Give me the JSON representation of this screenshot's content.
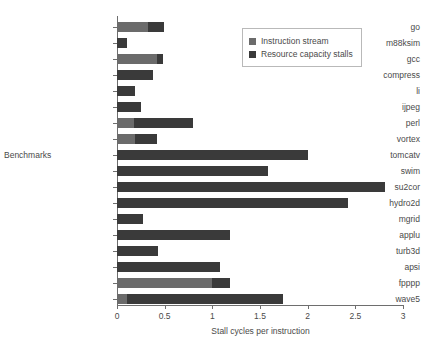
{
  "chart_data": {
    "type": "bar",
    "orientation": "horizontal",
    "stacked": true,
    "title": "",
    "xlabel": "Stall cycles per instruction",
    "ylabel": "Benchmarks",
    "xlim": [
      0,
      3
    ],
    "xticks": [
      0,
      0.5,
      1,
      1.5,
      2,
      2.5,
      3
    ],
    "xtick_labels": [
      "0",
      "0.5",
      "1",
      "1.5",
      "2",
      "2.5",
      "3"
    ],
    "grid": false,
    "legend_position": "top-right",
    "categories": [
      "go",
      "m88ksim",
      "gcc",
      "compress",
      "li",
      "ijpeg",
      "perl",
      "vortex",
      "tomcatv",
      "swim",
      "su2cor",
      "hydro2d",
      "mgrid",
      "applu",
      "turb3d",
      "apsi",
      "fpppp",
      "wave5"
    ],
    "series": [
      {
        "name": "Instruction stream",
        "color": "#6b6b6b",
        "values": [
          0.33,
          0.0,
          0.42,
          0.0,
          0.0,
          0.0,
          0.18,
          0.19,
          0.0,
          0.0,
          0.0,
          0.0,
          0.0,
          0.0,
          0.0,
          0.0,
          1.0,
          0.1
        ]
      },
      {
        "name": "Resource capacity stalls",
        "color": "#3a3a3a",
        "values": [
          0.16,
          0.1,
          0.06,
          0.38,
          0.19,
          0.25,
          0.62,
          0.23,
          2.0,
          1.58,
          2.81,
          2.42,
          0.27,
          1.19,
          0.43,
          1.08,
          0.19,
          1.64
        ]
      }
    ],
    "totals": [
      0.49,
      0.1,
      0.48,
      0.38,
      0.19,
      0.25,
      0.8,
      0.42,
      2.0,
      1.58,
      2.81,
      2.42,
      0.27,
      1.19,
      0.43,
      1.08,
      1.19,
      1.74
    ]
  },
  "legend": {
    "items": [
      {
        "label": "Instruction stream",
        "color": "#6b6b6b"
      },
      {
        "label": "Resource capacity stalls",
        "color": "#3a3a3a"
      }
    ]
  }
}
